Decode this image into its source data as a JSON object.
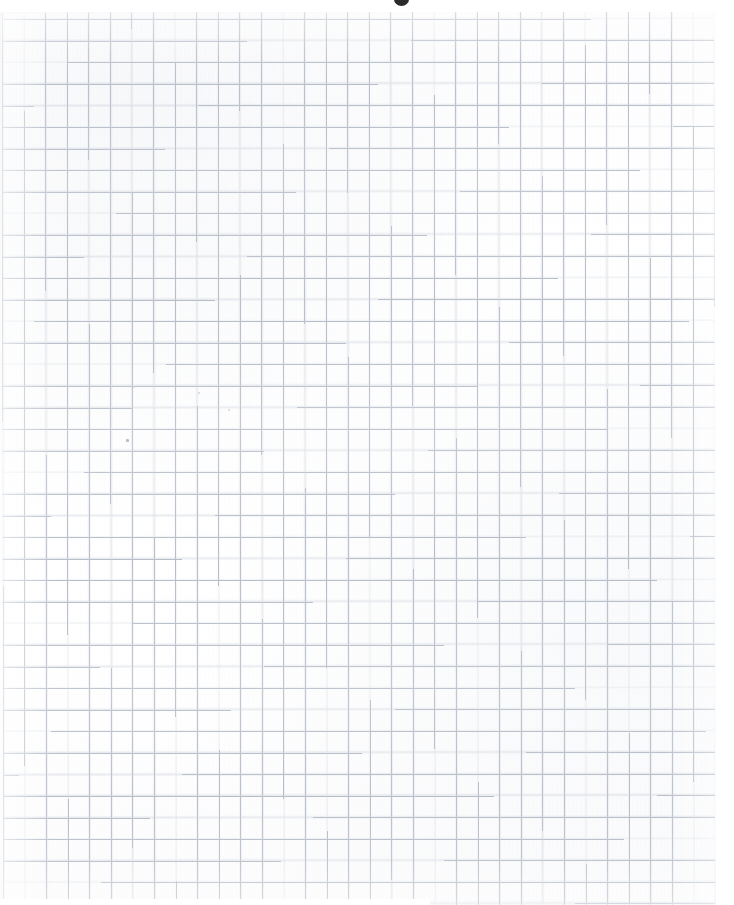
{
  "document": {
    "kind": "scanned-graph-paper",
    "title": "",
    "visible_text": "",
    "content_note": "blank",
    "page_width_px": 734,
    "page_height_px": 905,
    "background_color": "#ffffff"
  },
  "grid": {
    "name": "quadrille-grid",
    "cell_size_px": 21.58,
    "columns": 33,
    "rows": 41,
    "line_color": "#b0b7c3",
    "line_color_soft": "#c6ccd6",
    "line_width_px": 0.8,
    "origin_x_px": 2,
    "origin_y_px": 13,
    "width_px": 712,
    "height_px": 892,
    "skew_deg": -0.07
  },
  "margins": {
    "top_px": 12,
    "right_px": 18,
    "bottom_left_px": 6,
    "color": "#ffffff"
  },
  "artifacts": [
    {
      "name": "top-center-smudge",
      "type": "ink-smudge",
      "x": 394,
      "y": -3,
      "width": 15,
      "height": 9,
      "color": "#2b2b2e"
    },
    {
      "name": "dust-speck-left",
      "type": "dust-speck",
      "x": 126,
      "y": 439,
      "width": 3,
      "height": 3,
      "color": "#b9bcc2"
    },
    {
      "name": "dust-speck-upper",
      "type": "dust-speck",
      "x": 133,
      "y": 386,
      "width": 2,
      "height": 2,
      "color": "#d3d6db"
    },
    {
      "name": "dust-speck-mid",
      "type": "dust-speck",
      "x": 198,
      "y": 392,
      "width": 2,
      "height": 2,
      "color": "#d3d6db"
    },
    {
      "name": "dust-speck-right",
      "type": "dust-speck",
      "x": 228,
      "y": 409,
      "width": 2,
      "height": 2,
      "color": "#d3d6db"
    }
  ]
}
